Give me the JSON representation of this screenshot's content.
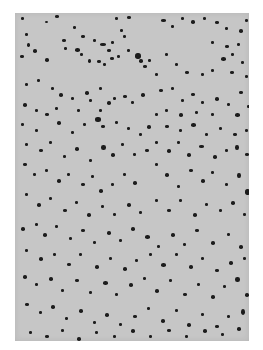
{
  "figure": {
    "caption_fragment": "· · ·   · ·· · ·  ···········",
    "photo": {
      "description": "micrograph of dark particles scattered on light gray background",
      "background_color": "#c6c6c6",
      "speck_color": "#1c1c1c",
      "specks": [
        [
          6,
          4,
          3,
          3
        ],
        [
          30,
          8,
          3,
          2
        ],
        [
          40,
          2,
          4,
          3
        ],
        [
          58,
          13,
          3,
          3
        ],
        [
          66,
          22,
          4,
          3
        ],
        [
          78,
          26,
          3,
          3
        ],
        [
          85,
          30,
          6,
          3
        ],
        [
          92,
          36,
          4,
          3
        ],
        [
          10,
          20,
          3,
          3
        ],
        [
          12,
          30,
          3,
          4
        ],
        [
          5,
          42,
          4,
          3
        ],
        [
          18,
          36,
          4,
          4
        ],
        [
          30,
          45,
          4,
          4
        ],
        [
          47,
          26,
          4,
          3
        ],
        [
          49,
          34,
          3,
          3
        ],
        [
          60,
          35,
          5,
          4
        ],
        [
          65,
          40,
          3,
          3
        ],
        [
          73,
          46,
          3,
          4
        ],
        [
          82,
          47,
          4,
          3
        ],
        [
          88,
          50,
          3,
          3
        ],
        [
          95,
          44,
          4,
          3
        ],
        [
          102,
          42,
          3,
          3
        ],
        [
          112,
          3,
          4,
          3
        ],
        [
          100,
          4,
          3,
          3
        ],
        [
          105,
          16,
          3,
          3
        ],
        [
          108,
          22,
          3,
          3
        ],
        [
          96,
          28,
          3,
          3
        ],
        [
          112,
          36,
          3,
          3
        ],
        [
          120,
          40,
          6,
          6
        ],
        [
          124,
          46,
          4,
          4
        ],
        [
          128,
          52,
          4,
          3
        ],
        [
          133,
          46,
          3,
          3
        ],
        [
          140,
          60,
          3,
          3
        ],
        [
          146,
          6,
          5,
          3
        ],
        [
          156,
          12,
          3,
          3
        ],
        [
          166,
          4,
          3,
          3
        ],
        [
          176,
          7,
          4,
          4
        ],
        [
          188,
          4,
          3,
          3
        ],
        [
          200,
          8,
          4,
          3
        ],
        [
          210,
          14,
          3,
          3
        ],
        [
          224,
          16,
          4,
          4
        ],
        [
          230,
          6,
          3,
          3
        ],
        [
          196,
          28,
          3,
          3
        ],
        [
          210,
          32,
          4,
          3
        ],
        [
          222,
          30,
          3,
          3
        ],
        [
          206,
          44,
          5,
          4
        ],
        [
          216,
          40,
          3,
          3
        ],
        [
          226,
          48,
          3,
          3
        ],
        [
          150,
          40,
          3,
          3
        ],
        [
          160,
          50,
          3,
          3
        ],
        [
          170,
          58,
          4,
          3
        ],
        [
          186,
          60,
          3,
          3
        ],
        [
          196,
          56,
          3,
          3
        ],
        [
          215,
          58,
          4,
          3
        ],
        [
          230,
          62,
          3,
          3
        ],
        [
          10,
          70,
          3,
          3
        ],
        [
          22,
          66,
          3,
          3
        ],
        [
          36,
          74,
          3,
          3
        ],
        [
          44,
          80,
          4,
          4
        ],
        [
          56,
          84,
          3,
          3
        ],
        [
          70,
          78,
          4,
          4
        ],
        [
          74,
          86,
          3,
          3
        ],
        [
          84,
          74,
          3,
          3
        ],
        [
          92,
          88,
          4,
          4
        ],
        [
          98,
          84,
          3,
          3
        ],
        [
          108,
          82,
          4,
          3
        ],
        [
          116,
          88,
          3,
          3
        ],
        [
          126,
          80,
          4,
          4
        ],
        [
          8,
          90,
          4,
          4
        ],
        [
          20,
          96,
          3,
          3
        ],
        [
          40,
          94,
          3,
          3
        ],
        [
          30,
          100,
          4,
          3
        ],
        [
          62,
          96,
          3,
          3
        ],
        [
          84,
          96,
          3,
          3
        ],
        [
          144,
          76,
          4,
          3
        ],
        [
          156,
          74,
          3,
          3
        ],
        [
          166,
          86,
          3,
          3
        ],
        [
          176,
          80,
          4,
          3
        ],
        [
          186,
          88,
          3,
          3
        ],
        [
          200,
          84,
          4,
          4
        ],
        [
          212,
          90,
          3,
          3
        ],
        [
          224,
          78,
          4,
          3
        ],
        [
          232,
          92,
          3,
          3
        ],
        [
          150,
          96,
          3,
          3
        ],
        [
          164,
          100,
          4,
          4
        ],
        [
          180,
          98,
          3,
          3
        ],
        [
          196,
          100,
          3,
          3
        ],
        [
          220,
          100,
          5,
          4
        ],
        [
          6,
          110,
          3,
          3
        ],
        [
          20,
          116,
          3,
          3
        ],
        [
          42,
          108,
          4,
          4
        ],
        [
          56,
          118,
          3,
          3
        ],
        [
          68,
          110,
          3,
          3
        ],
        [
          80,
          104,
          6,
          5
        ],
        [
          86,
          112,
          4,
          3
        ],
        [
          100,
          108,
          3,
          3
        ],
        [
          112,
          114,
          3,
          3
        ],
        [
          124,
          120,
          3,
          3
        ],
        [
          132,
          112,
          4,
          4
        ],
        [
          140,
          100,
          3,
          3
        ],
        [
          150,
          112,
          4,
          3
        ],
        [
          164,
          116,
          3,
          3
        ],
        [
          176,
          110,
          5,
          4
        ],
        [
          190,
          120,
          3,
          3
        ],
        [
          204,
          114,
          3,
          3
        ],
        [
          218,
          120,
          4,
          3
        ],
        [
          230,
          116,
          3,
          3
        ],
        [
          10,
          130,
          3,
          3
        ],
        [
          24,
          136,
          4,
          3
        ],
        [
          34,
          128,
          3,
          3
        ],
        [
          48,
          142,
          3,
          3
        ],
        [
          60,
          134,
          4,
          4
        ],
        [
          74,
          146,
          3,
          3
        ],
        [
          86,
          132,
          5,
          5
        ],
        [
          96,
          140,
          4,
          4
        ],
        [
          106,
          130,
          3,
          3
        ],
        [
          118,
          140,
          3,
          3
        ],
        [
          130,
          136,
          4,
          3
        ],
        [
          140,
          128,
          3,
          3
        ],
        [
          152,
          136,
          4,
          4
        ],
        [
          162,
          128,
          3,
          3
        ],
        [
          172,
          140,
          4,
          4
        ],
        [
          184,
          132,
          5,
          3
        ],
        [
          198,
          142,
          4,
          4
        ],
        [
          210,
          136,
          3,
          3
        ],
        [
          220,
          132,
          4,
          5
        ],
        [
          230,
          140,
          4,
          3
        ],
        [
          8,
          150,
          4,
          3
        ],
        [
          18,
          160,
          3,
          3
        ],
        [
          30,
          156,
          3,
          3
        ],
        [
          42,
          166,
          4,
          4
        ],
        [
          52,
          160,
          3,
          3
        ],
        [
          66,
          170,
          4,
          3
        ],
        [
          76,
          162,
          3,
          3
        ],
        [
          84,
          176,
          4,
          4
        ],
        [
          96,
          170,
          3,
          3
        ],
        [
          108,
          160,
          3,
          3
        ],
        [
          118,
          168,
          4,
          4
        ],
        [
          140,
          150,
          3,
          3
        ],
        [
          150,
          160,
          4,
          4
        ],
        [
          162,
          172,
          3,
          3
        ],
        [
          174,
          156,
          4,
          3
        ],
        [
          186,
          166,
          4,
          4
        ],
        [
          196,
          158,
          3,
          3
        ],
        [
          210,
          170,
          3,
          3
        ],
        [
          222,
          160,
          4,
          5
        ],
        [
          230,
          176,
          5,
          6
        ],
        [
          10,
          180,
          3,
          3
        ],
        [
          22,
          190,
          4,
          4
        ],
        [
          34,
          184,
          3,
          3
        ],
        [
          48,
          196,
          4,
          3
        ],
        [
          60,
          188,
          3,
          3
        ],
        [
          72,
          200,
          4,
          4
        ],
        [
          86,
          192,
          3,
          3
        ],
        [
          98,
          200,
          3,
          3
        ],
        [
          112,
          190,
          4,
          4
        ],
        [
          124,
          198,
          3,
          3
        ],
        [
          140,
          186,
          3,
          3
        ],
        [
          152,
          196,
          4,
          3
        ],
        [
          164,
          186,
          3,
          3
        ],
        [
          178,
          200,
          4,
          4
        ],
        [
          190,
          190,
          3,
          3
        ],
        [
          204,
          196,
          3,
          3
        ],
        [
          216,
          188,
          4,
          4
        ],
        [
          228,
          200,
          3,
          3
        ],
        [
          6,
          214,
          4,
          4
        ],
        [
          20,
          210,
          3,
          3
        ],
        [
          28,
          220,
          4,
          4
        ],
        [
          40,
          212,
          3,
          3
        ],
        [
          54,
          224,
          3,
          3
        ],
        [
          66,
          216,
          4,
          3
        ],
        [
          78,
          228,
          3,
          3
        ],
        [
          92,
          218,
          4,
          4
        ],
        [
          104,
          226,
          3,
          3
        ],
        [
          116,
          214,
          4,
          4
        ],
        [
          130,
          222,
          5,
          4
        ],
        [
          142,
          232,
          3,
          3
        ],
        [
          156,
          220,
          4,
          4
        ],
        [
          168,
          230,
          3,
          3
        ],
        [
          180,
          216,
          4,
          3
        ],
        [
          196,
          228,
          4,
          4
        ],
        [
          212,
          220,
          3,
          3
        ],
        [
          224,
          232,
          4,
          4
        ],
        [
          10,
          236,
          3,
          3
        ],
        [
          24,
          244,
          4,
          4
        ],
        [
          38,
          240,
          3,
          3
        ],
        [
          52,
          250,
          4,
          3
        ],
        [
          64,
          240,
          3,
          3
        ],
        [
          80,
          252,
          4,
          4
        ],
        [
          94,
          244,
          3,
          3
        ],
        [
          108,
          254,
          4,
          4
        ],
        [
          120,
          246,
          3,
          3
        ],
        [
          134,
          240,
          3,
          3
        ],
        [
          146,
          250,
          5,
          4
        ],
        [
          160,
          240,
          3,
          3
        ],
        [
          174,
          252,
          4,
          4
        ],
        [
          186,
          244,
          3,
          3
        ],
        [
          200,
          256,
          4,
          3
        ],
        [
          214,
          248,
          4,
          4
        ],
        [
          228,
          244,
          3,
          3
        ],
        [
          8,
          262,
          4,
          4
        ],
        [
          20,
          270,
          3,
          3
        ],
        [
          34,
          264,
          4,
          4
        ],
        [
          46,
          276,
          3,
          3
        ],
        [
          60,
          266,
          4,
          3
        ],
        [
          74,
          278,
          3,
          3
        ],
        [
          88,
          268,
          5,
          4
        ],
        [
          100,
          280,
          3,
          3
        ],
        [
          114,
          270,
          4,
          4
        ],
        [
          128,
          264,
          3,
          3
        ],
        [
          140,
          276,
          4,
          4
        ],
        [
          154,
          266,
          3,
          3
        ],
        [
          168,
          280,
          4,
          3
        ],
        [
          182,
          270,
          3,
          3
        ],
        [
          196,
          282,
          4,
          4
        ],
        [
          208,
          272,
          3,
          3
        ],
        [
          220,
          264,
          5,
          5
        ],
        [
          230,
          280,
          4,
          4
        ],
        [
          10,
          290,
          4,
          3
        ],
        [
          24,
          298,
          3,
          3
        ],
        [
          36,
          292,
          4,
          4
        ],
        [
          50,
          304,
          3,
          3
        ],
        [
          64,
          296,
          4,
          4
        ],
        [
          78,
          308,
          3,
          3
        ],
        [
          90,
          300,
          4,
          4
        ],
        [
          104,
          310,
          3,
          3
        ],
        [
          118,
          302,
          4,
          3
        ],
        [
          132,
          294,
          3,
          3
        ],
        [
          146,
          306,
          4,
          4
        ],
        [
          160,
          296,
          3,
          3
        ],
        [
          172,
          310,
          4,
          4
        ],
        [
          186,
          300,
          3,
          3
        ],
        [
          200,
          312,
          4,
          3
        ],
        [
          212,
          302,
          3,
          3
        ],
        [
          226,
          296,
          4,
          6
        ],
        [
          14,
          318,
          3,
          3
        ],
        [
          30,
          322,
          4,
          3
        ],
        [
          46,
          316,
          3,
          3
        ],
        [
          62,
          324,
          4,
          4
        ],
        [
          80,
          318,
          3,
          3
        ],
        [
          98,
          322,
          3,
          3
        ],
        [
          116,
          316,
          4,
          4
        ],
        [
          134,
          322,
          3,
          3
        ],
        [
          152,
          316,
          4,
          3
        ],
        [
          170,
          322,
          3,
          3
        ],
        [
          188,
          316,
          4,
          4
        ],
        [
          206,
          320,
          3,
          3
        ],
        [
          222,
          314,
          4,
          4
        ]
      ]
    }
  }
}
